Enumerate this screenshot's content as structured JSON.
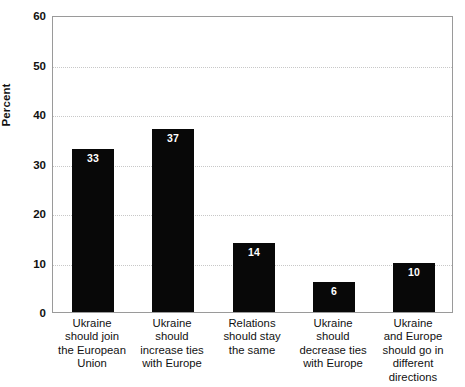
{
  "chart_data": {
    "type": "bar",
    "title": "",
    "xlabel": "",
    "ylabel": "Percent",
    "ylim": [
      0,
      60
    ],
    "yticks": [
      0,
      10,
      20,
      30,
      40,
      50,
      60
    ],
    "ytick_labels": [
      "0",
      "10",
      "20",
      "30",
      "40",
      "50",
      "60"
    ],
    "grid": "horizontal-dotted",
    "legend": "none",
    "bar_color": "#080808",
    "value_label_color": "#ffffff",
    "categories": [
      "Ukraine should join the European Union",
      "Ukraine should increase ties with Europe",
      "Relations should stay the same",
      "Ukraine should decrease ties with Europe",
      "Ukraine and Europe should go in different directions"
    ],
    "category_lines": [
      [
        "Ukraine",
        "should join",
        "the European",
        "Union"
      ],
      [
        "Ukraine",
        "should",
        "increase ties",
        "with Europe"
      ],
      [
        "Relations",
        "should stay",
        "the same"
      ],
      [
        "Ukraine",
        "should",
        "decrease ties",
        "with Europe"
      ],
      [
        "Ukraine",
        "and Europe",
        "should go in",
        "different",
        "directions"
      ]
    ],
    "values": [
      33,
      37,
      14,
      6,
      10
    ],
    "value_labels": [
      "33",
      "37",
      "14",
      "6",
      "10"
    ]
  }
}
